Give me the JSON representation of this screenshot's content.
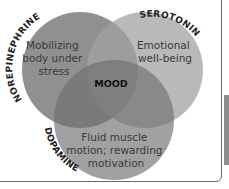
{
  "diagram": {
    "type": "venn",
    "center_label": "MOOD",
    "sets": [
      {
        "name": "NOREPINEPHRINE",
        "description": [
          "Mobilizing",
          "body under",
          "stress"
        ],
        "color": "#7f7f7f"
      },
      {
        "name": "SEROTONIN",
        "description": [
          "Emotional",
          "well-being"
        ],
        "color": "#9a9a9a"
      },
      {
        "name": "DOPAMINE",
        "description": [
          "Fluid muscle",
          "motion; rewarding",
          "motivation"
        ],
        "color": "#888888"
      }
    ]
  }
}
